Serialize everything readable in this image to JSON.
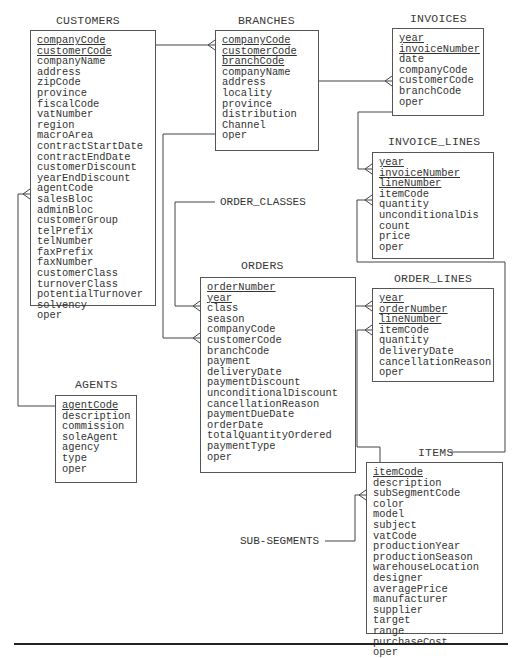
{
  "diagram": {
    "type": "entity-relationship",
    "entities": [
      {
        "name": "CUSTOMERS",
        "primary_keys": [
          "companyCode",
          "customerCode"
        ],
        "fields": [
          "companyCode",
          "customerCode",
          "companyName",
          "address",
          "zipCode",
          "province",
          "fiscalCode",
          "vatNumber",
          "region",
          "macroArea",
          "contractStartDate",
          "contractEndDate",
          "customerDiscount",
          "yearEndDiscount",
          "agentCode",
          "salesBloc",
          "adminBloc",
          "customerGroup",
          "telPrefix",
          "telNumber",
          "faxPrefix",
          "faxNumber",
          "customerClass",
          "turnoverClass",
          "potentialTurnover",
          "solvency",
          "oper"
        ]
      },
      {
        "name": "BRANCHES",
        "primary_keys": [
          "companyCode",
          "customerCode",
          "branchCode"
        ],
        "fields": [
          "companyCode",
          "customerCode",
          "branchCode",
          "companyName",
          "address",
          "locality",
          "province",
          "distribution",
          "Channel",
          "oper"
        ]
      },
      {
        "name": "INVOICES",
        "primary_keys": [
          "year",
          "invoiceNumber"
        ],
        "fields": [
          "year",
          "invoiceNumber",
          "date",
          "companyCode",
          "customerCode",
          "branchCode",
          "oper"
        ]
      },
      {
        "name": "INVOICE_LINES",
        "primary_keys": [
          "year",
          "invoiceNumber",
          "lineNumber"
        ],
        "fields": [
          "year",
          "invoiceNumber",
          "lineNumber",
          "itemCode",
          "quantity",
          "unconditionalDis",
          "count",
          "price",
          "oper"
        ]
      },
      {
        "name": "ORDERS",
        "primary_keys": [
          "orderNumber",
          "year"
        ],
        "fields": [
          "orderNumber",
          "year",
          "class",
          "season",
          "companyCode",
          "customerCode",
          "branchCode",
          "payment",
          "deliveryDate",
          "paymentDiscount",
          "unconditionalDiscount",
          "cancellationReason",
          "paymentDueDate",
          "orderDate",
          "totalQuantityOrdered",
          "paymentType",
          "oper"
        ]
      },
      {
        "name": "ORDER_LINES",
        "primary_keys": [
          "year",
          "orderNumber",
          "lineNumber"
        ],
        "fields": [
          "year",
          "orderNumber",
          "lineNumber",
          "itemCode",
          "quantity",
          "deliveryDate",
          "cancellationReason",
          "oper"
        ]
      },
      {
        "name": "AGENTS",
        "primary_keys": [
          "agentCode"
        ],
        "fields": [
          "agentCode",
          "description",
          "commission",
          "soleAgent",
          "agency",
          "type",
          "oper"
        ]
      },
      {
        "name": "ITEMS",
        "primary_keys": [
          "itemCode"
        ],
        "fields": [
          "itemCode",
          "description",
          "subSegmentCode",
          "color",
          "model",
          "subject",
          "vatCode",
          "productionYear",
          "productionSeason",
          "warehouseLocation",
          "designer",
          "averagePrice",
          "manufacturer",
          "supplier",
          "target",
          "range",
          "purchaseCost",
          "oper"
        ]
      }
    ],
    "external_labels": [
      "ORDER_CLASSES",
      "SUB-SEGMENTS"
    ],
    "relationships": [
      {
        "from": "CUSTOMERS",
        "to": "BRANCHES",
        "to_field": "companyCode",
        "cardinality": "one-to-many"
      },
      {
        "from": "BRANCHES",
        "to": "INVOICES",
        "to_field": "customerCode",
        "cardinality": "one-to-many"
      },
      {
        "from": "INVOICES",
        "to": "INVOICE_LINES",
        "to_field": "year",
        "cardinality": "one-to-many"
      },
      {
        "from": "ITEMS",
        "to": "INVOICE_LINES",
        "to_field": "itemCode",
        "cardinality": "one-to-many"
      },
      {
        "from": "ORDER_CLASSES",
        "to": "ORDERS",
        "to_field": "class",
        "cardinality": "one-to-many"
      },
      {
        "from": "BRANCHES",
        "to": "ORDERS",
        "to_field": "customerCode",
        "cardinality": "one-to-many"
      },
      {
        "from": "ORDERS",
        "to": "ORDER_LINES",
        "to_field": "year",
        "cardinality": "one-to-many"
      },
      {
        "from": "ITEMS",
        "to": "ORDER_LINES",
        "to_field": "itemCode",
        "cardinality": "one-to-many"
      },
      {
        "from": "AGENTS",
        "to": "CUSTOMERS",
        "to_field": "agentCode",
        "cardinality": "one-to-many"
      },
      {
        "from": "SUB-SEGMENTS",
        "to": "ITEMS",
        "to_field": "subSegmentCode",
        "cardinality": "one-to-many"
      }
    ]
  },
  "colors": {
    "line": "#444444",
    "text": "#333333",
    "background": "#ffffff"
  }
}
